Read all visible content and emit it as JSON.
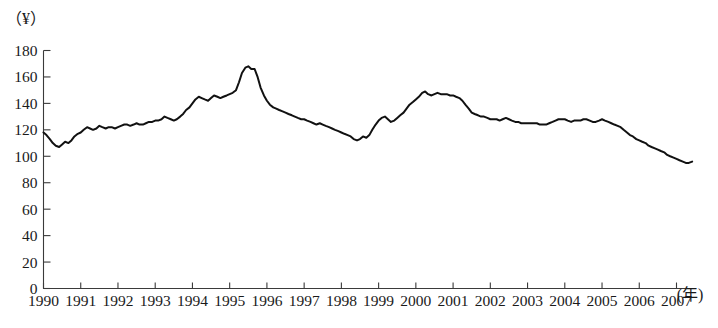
{
  "figure": {
    "y_axis_unit_label": "（¥）",
    "x_axis_unit_label": "(年)",
    "caption": ""
  },
  "chart_data": {
    "type": "line",
    "title": "",
    "subtitle": "",
    "xlabel": "(年)",
    "ylabel": "（¥）",
    "xlim": [
      1990,
      2007.6
    ],
    "ylim": [
      0,
      180
    ],
    "grid": false,
    "legend": null,
    "y_ticks": [
      0,
      20,
      40,
      60,
      80,
      100,
      120,
      140,
      160,
      180
    ],
    "y_tick_labels": [
      "0",
      "20",
      "40",
      "60",
      "80",
      "100",
      "120",
      "140",
      "160",
      "180"
    ],
    "x_ticks": [
      1990,
      1991,
      1992,
      1993,
      1994,
      1995,
      1996,
      1997,
      1998,
      1999,
      2000,
      2001,
      2002,
      2003,
      2004,
      2005,
      2006,
      2007
    ],
    "x_tick_labels": [
      "1990",
      "1991",
      "1992",
      "1993",
      "1994",
      "1995",
      "1996",
      "1997",
      "1998",
      "1999",
      "2000",
      "2001",
      "2002",
      "2003",
      "2004",
      "2005",
      "2006",
      "2007"
    ],
    "line_color": "#111111",
    "series": [
      {
        "name": "index",
        "x": [
          1990.0,
          1990.08,
          1990.17,
          1990.25,
          1990.33,
          1990.42,
          1990.5,
          1990.58,
          1990.67,
          1990.75,
          1990.83,
          1990.92,
          1991.0,
          1991.08,
          1991.17,
          1991.25,
          1991.33,
          1991.42,
          1991.5,
          1991.58,
          1991.67,
          1991.75,
          1991.83,
          1991.92,
          1992.0,
          1992.08,
          1992.17,
          1992.25,
          1992.33,
          1992.42,
          1992.5,
          1992.58,
          1992.67,
          1992.75,
          1992.83,
          1992.92,
          1993.0,
          1993.08,
          1993.17,
          1993.25,
          1993.33,
          1993.42,
          1993.5,
          1993.58,
          1993.67,
          1993.75,
          1993.83,
          1993.92,
          1994.0,
          1994.08,
          1994.17,
          1994.25,
          1994.33,
          1994.42,
          1994.5,
          1994.58,
          1994.67,
          1994.75,
          1994.83,
          1994.92,
          1995.0,
          1995.08,
          1995.17,
          1995.25,
          1995.33,
          1995.42,
          1995.5,
          1995.58,
          1995.67,
          1995.75,
          1995.83,
          1995.92,
          1996.0,
          1996.08,
          1996.17,
          1996.25,
          1996.33,
          1996.42,
          1996.5,
          1996.58,
          1996.67,
          1996.75,
          1996.83,
          1996.92,
          1997.0,
          1997.08,
          1997.17,
          1997.25,
          1997.33,
          1997.42,
          1997.5,
          1997.58,
          1997.67,
          1997.75,
          1997.83,
          1997.92,
          1998.0,
          1998.08,
          1998.17,
          1998.25,
          1998.33,
          1998.42,
          1998.5,
          1998.58,
          1998.67,
          1998.75,
          1998.83,
          1998.92,
          1999.0,
          1999.08,
          1999.17,
          1999.25,
          1999.33,
          1999.42,
          1999.5,
          1999.58,
          1999.67,
          1999.75,
          1999.83,
          1999.92,
          2000.0,
          2000.08,
          2000.17,
          2000.25,
          2000.33,
          2000.42,
          2000.5,
          2000.58,
          2000.67,
          2000.75,
          2000.83,
          2000.92,
          2001.0,
          2001.08,
          2001.17,
          2001.25,
          2001.33,
          2001.42,
          2001.5,
          2001.58,
          2001.67,
          2001.75,
          2001.83,
          2001.92,
          2002.0,
          2002.08,
          2002.17,
          2002.25,
          2002.33,
          2002.42,
          2002.5,
          2002.58,
          2002.67,
          2002.75,
          2002.83,
          2002.92,
          2003.0,
          2003.08,
          2003.17,
          2003.25,
          2003.33,
          2003.42,
          2003.5,
          2003.58,
          2003.67,
          2003.75,
          2003.83,
          2003.92,
          2004.0,
          2004.08,
          2004.17,
          2004.25,
          2004.33,
          2004.42,
          2004.5,
          2004.58,
          2004.67,
          2004.75,
          2004.83,
          2004.92,
          2005.0,
          2005.08,
          2005.17,
          2005.25,
          2005.33,
          2005.42,
          2005.5,
          2005.58,
          2005.67,
          2005.75,
          2005.83,
          2005.92,
          2006.0,
          2006.08,
          2006.17,
          2006.25,
          2006.33,
          2006.42,
          2006.5,
          2006.58,
          2006.67,
          2006.75,
          2006.83,
          2006.92,
          2007.0,
          2007.08,
          2007.17,
          2007.25,
          2007.33,
          2007.42
        ],
        "values": [
          118,
          116,
          113,
          110,
          108,
          107,
          109,
          111,
          110,
          112,
          115,
          117,
          118,
          120,
          122,
          121,
          120,
          121,
          123,
          122,
          121,
          122,
          122,
          121,
          122,
          123,
          124,
          124,
          123,
          124,
          125,
          124,
          124,
          125,
          126,
          126,
          127,
          127,
          128,
          130,
          129,
          128,
          127,
          128,
          130,
          132,
          135,
          137,
          140,
          143,
          145,
          144,
          143,
          142,
          144,
          146,
          145,
          144,
          145,
          146,
          147,
          148,
          150,
          156,
          163,
          167,
          168,
          166,
          166,
          160,
          152,
          146,
          142,
          139,
          137,
          136,
          135,
          134,
          133,
          132,
          131,
          130,
          129,
          128,
          128,
          127,
          126,
          125,
          124,
          125,
          124,
          123,
          122,
          121,
          120,
          119,
          118,
          117,
          116,
          115,
          113,
          112,
          113,
          115,
          114,
          116,
          120,
          124,
          127,
          129,
          130,
          128,
          126,
          127,
          129,
          131,
          133,
          136,
          139,
          141,
          143,
          145,
          148,
          149,
          147,
          146,
          147,
          148,
          147,
          147,
          147,
          146,
          146,
          145,
          144,
          142,
          139,
          136,
          133,
          132,
          131,
          130,
          130,
          129,
          128,
          128,
          128,
          127,
          128,
          129,
          128,
          127,
          126,
          126,
          125,
          125,
          125,
          125,
          125,
          125,
          124,
          124,
          124,
          125,
          126,
          127,
          128,
          128,
          128,
          127,
          126,
          127,
          127,
          127,
          128,
          128,
          127,
          126,
          126,
          127,
          128,
          127,
          126,
          125,
          124,
          123,
          122,
          120,
          118,
          116,
          115,
          113,
          112,
          111,
          110,
          108,
          107,
          106,
          105,
          104,
          103,
          101,
          100,
          99,
          98,
          97,
          96,
          95,
          95,
          96
        ]
      }
    ]
  }
}
